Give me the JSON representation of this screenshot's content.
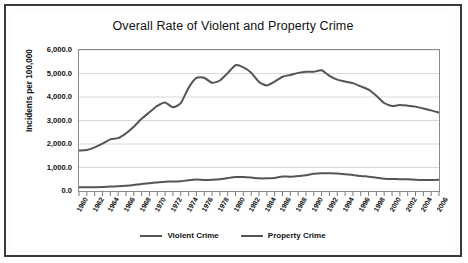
{
  "chart_data": {
    "type": "line",
    "title": "Overall Rate of Violent and Property Crime",
    "xlabel": "",
    "ylabel": "Incidents per 100,000",
    "xlim": [
      1960,
      2006
    ],
    "ylim": [
      0,
      6000
    ],
    "grid": true,
    "legend_position": "bottom",
    "ytick_labels": [
      "6,000.0",
      "5,000.0",
      "4,000.0",
      "3,000.0",
      "2,000.0",
      "1,000.0",
      "0.0"
    ],
    "ytick_values": [
      6000,
      5000,
      4000,
      3000,
      2000,
      1000,
      0
    ],
    "xtick_labels": [
      "1960",
      "1962",
      "1964",
      "1966",
      "1968",
      "1970",
      "1972",
      "1974",
      "1976",
      "1978",
      "1980",
      "1982",
      "1984",
      "1986",
      "1988",
      "1990",
      "1992",
      "1994",
      "1996",
      "1998",
      "2000",
      "2002",
      "2004",
      "2006"
    ],
    "x": [
      1960,
      1961,
      1962,
      1963,
      1964,
      1965,
      1966,
      1967,
      1968,
      1969,
      1970,
      1971,
      1972,
      1973,
      1974,
      1975,
      1976,
      1977,
      1978,
      1979,
      1980,
      1981,
      1982,
      1983,
      1984,
      1985,
      1986,
      1987,
      1988,
      1989,
      1990,
      1991,
      1992,
      1993,
      1994,
      1995,
      1996,
      1997,
      1998,
      1999,
      2000,
      2001,
      2002,
      2003,
      2004,
      2005,
      2006
    ],
    "series": [
      {
        "name": "Violent Crime",
        "color": "#555555",
        "values": [
          161,
          158,
          162,
          168,
          190,
          200,
          220,
          254,
          298,
          329,
          364,
          396,
          401,
          417,
          461,
          488,
          468,
          476,
          498,
          549,
          597,
          594,
          571,
          538,
          539,
          557,
          618,
          610,
          637,
          666,
          730,
          758,
          758,
          747,
          714,
          685,
          637,
          611,
          568,
          523,
          507,
          505,
          495,
          476,
          464,
          469,
          474
        ]
      },
      {
        "name": "Property Crime",
        "color": "#555555",
        "values": [
          1726,
          1747,
          1857,
          2012,
          2198,
          2249,
          2451,
          2736,
          3071,
          3351,
          3621,
          3769,
          3561,
          3737,
          4389,
          4811,
          4820,
          4602,
          4703,
          5017,
          5353,
          5264,
          5033,
          4637,
          4492,
          4651,
          4863,
          4940,
          5027,
          5078,
          5073,
          5140,
          4903,
          4740,
          4660,
          4591,
          4451,
          4316,
          4052,
          3744,
          3618,
          3658,
          3631,
          3591,
          3514,
          3432,
          3335
        ]
      }
    ]
  },
  "legend": {
    "entries": [
      {
        "label": "Violent Crime"
      },
      {
        "label": "Property Crime"
      }
    ]
  }
}
